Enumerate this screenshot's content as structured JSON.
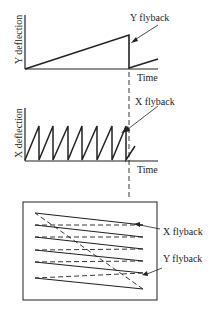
{
  "diagram": {
    "top_plot": {
      "y_label": "Y deflection",
      "x_label": "Time",
      "annotation": "Y flyback"
    },
    "middle_plot": {
      "y_label": "X deflection",
      "x_label": "Time",
      "annotation": "X flyback"
    },
    "raster": {
      "x_flyback_label": "X flyback",
      "y_flyback_label": "Y flyback"
    },
    "colors": {
      "line": "#222222",
      "background": "#ffffff"
    }
  }
}
